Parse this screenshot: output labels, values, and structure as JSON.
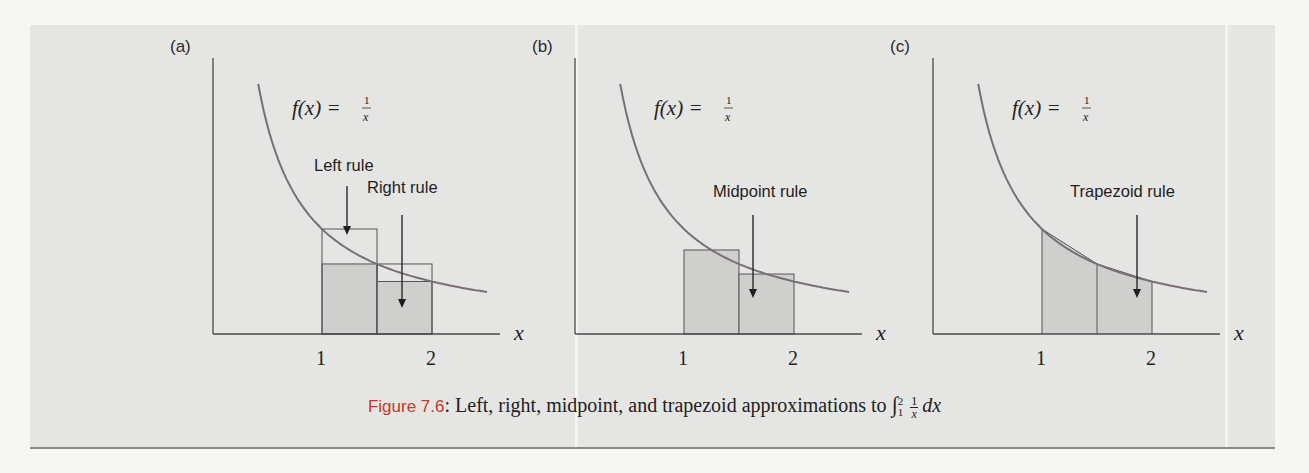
{
  "figure": {
    "caption": {
      "label": "Figure 7.6",
      "separator": ":",
      "text": " Left, right, midpoint, and trapezoid approximations to ",
      "integral": {
        "sign": "∫",
        "upper": "2",
        "lower": "1",
        "numerator": "1",
        "denominator": "x",
        "differential": "dx"
      }
    },
    "colors": {
      "panel_bg": "#e5e5e3",
      "curve": "#7a6f78",
      "axis": "#4a4a4a",
      "shade": "#cfcfcd",
      "box_outline": "#555555",
      "figure_label": "#c0392b"
    },
    "function_label": {
      "lhs": "f(x) = ",
      "numerator": "1",
      "denominator": "x"
    },
    "axis_label": "x",
    "ticks": [
      "1",
      "2"
    ]
  },
  "chart_data": [
    {
      "type": "line",
      "panel": "(a)",
      "title": "Left and right rule approximations",
      "function": "f(x) = 1/x",
      "xlabel": "x",
      "ylabel": "",
      "x_ticks": [
        1,
        2
      ],
      "x_range": [
        0,
        2.6
      ],
      "curve_domain": [
        0.42,
        2.5
      ],
      "subintervals": [
        [
          1,
          1.5
        ],
        [
          1.5,
          2
        ]
      ],
      "annotations": [
        "Left rule",
        "Right rule"
      ],
      "left_rule_heights": [
        1.0,
        0.667
      ],
      "right_rule_heights": [
        0.667,
        0.5
      ],
      "grid": false
    },
    {
      "type": "line",
      "panel": "(b)",
      "title": "Midpoint rule approximation",
      "function": "f(x) = 1/x",
      "xlabel": "x",
      "ylabel": "",
      "x_ticks": [
        1,
        2
      ],
      "x_range": [
        0,
        2.6
      ],
      "curve_domain": [
        0.42,
        2.5
      ],
      "subintervals": [
        [
          1,
          1.5
        ],
        [
          1.5,
          2
        ]
      ],
      "annotations": [
        "Midpoint rule"
      ],
      "midpoint_heights": [
        0.8,
        0.571
      ],
      "grid": false
    },
    {
      "type": "line",
      "panel": "(c)",
      "title": "Trapezoid rule approximation",
      "function": "f(x) = 1/x",
      "xlabel": "x",
      "ylabel": "",
      "x_ticks": [
        1,
        2
      ],
      "x_range": [
        0,
        2.6
      ],
      "curve_domain": [
        0.42,
        2.5
      ],
      "subintervals": [
        [
          1,
          1.5
        ],
        [
          1.5,
          2
        ]
      ],
      "annotations": [
        "Trapezoid rule"
      ],
      "trapezoid_vertices": [
        [
          1,
          1.0
        ],
        [
          1.5,
          0.667
        ],
        [
          2,
          0.5
        ]
      ],
      "grid": false
    }
  ],
  "panels": [
    {
      "id": "a",
      "label": "(a)",
      "origin_x": 212,
      "rules": [
        "Left rule",
        "Right rule"
      ]
    },
    {
      "id": "b",
      "label": "(b)",
      "origin_x": 574,
      "rules": [
        "Midpoint rule"
      ]
    },
    {
      "id": "c",
      "label": "(c)",
      "origin_x": 932,
      "rules": [
        "Trapezoid rule"
      ]
    }
  ]
}
